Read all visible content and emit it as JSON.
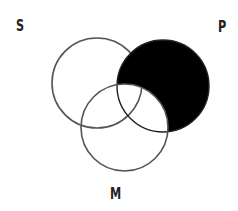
{
  "diagram": {
    "type": "venn",
    "sets": [
      {
        "id": "S",
        "label": "S",
        "cx": 97,
        "cy": 83,
        "r": 45
      },
      {
        "id": "P",
        "label": "P",
        "cx": 163,
        "cy": 86,
        "r": 46
      },
      {
        "id": "M",
        "label": "M",
        "cx": 124.5,
        "cy": 127.5,
        "r": 43.5
      }
    ],
    "shaded_region": "P minus M",
    "shade_color": "#000000",
    "stroke_color": "#555555"
  },
  "labels": {
    "s": "S",
    "p": "P",
    "m": "M"
  }
}
